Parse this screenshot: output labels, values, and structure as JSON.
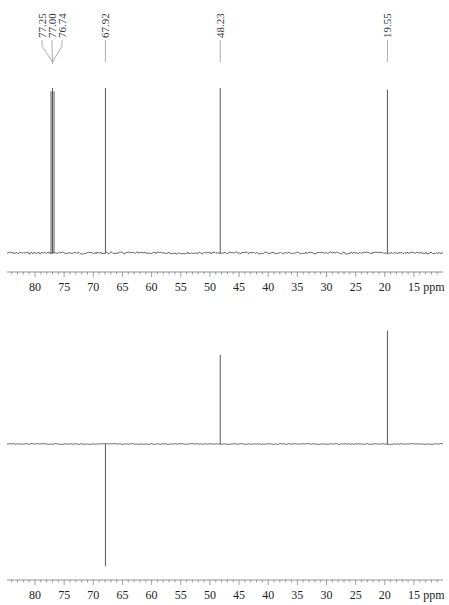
{
  "chart_data": [
    {
      "type": "line",
      "title": "13C NMR spectrum",
      "xlabel": "ppm",
      "ylabel": "",
      "xlim": [
        85,
        11
      ],
      "x_axis_reversed": true,
      "x_ticks": [
        80,
        75,
        70,
        65,
        60,
        55,
        50,
        45,
        40,
        35,
        30,
        25,
        20,
        15
      ],
      "x_unit_label": "ppm",
      "peaks": [
        {
          "ppm": 77.25,
          "label": "77.25",
          "height": 0.98,
          "sign": 1
        },
        {
          "ppm": 77.0,
          "label": "77.00",
          "height": 1.0,
          "sign": 1
        },
        {
          "ppm": 76.74,
          "label": "76.74",
          "height": 0.98,
          "sign": 1
        },
        {
          "ppm": 67.92,
          "label": "67.92",
          "height": 1.0,
          "sign": 1
        },
        {
          "ppm": 48.23,
          "label": "48.23",
          "height": 1.0,
          "sign": 1
        },
        {
          "ppm": 19.55,
          "label": "19.55",
          "height": 0.99,
          "sign": 1
        }
      ],
      "grid": false,
      "legend": null
    },
    {
      "type": "line",
      "title": "DEPT-135 spectrum",
      "xlabel": "ppm",
      "ylabel": "",
      "xlim": [
        85,
        11
      ],
      "x_axis_reversed": true,
      "x_ticks": [
        80,
        75,
        70,
        65,
        60,
        55,
        50,
        45,
        40,
        35,
        30,
        25,
        20,
        15
      ],
      "x_unit_label": "ppm",
      "peaks": [
        {
          "ppm": 67.92,
          "height": -1.0,
          "sign": -1,
          "note": "negative (CH2)"
        },
        {
          "ppm": 48.23,
          "height": 0.73,
          "sign": 1
        },
        {
          "ppm": 19.55,
          "height": 0.93,
          "sign": 1
        }
      ],
      "grid": false,
      "legend": null
    }
  ],
  "labels": {
    "peak_77_25": "77.25",
    "peak_77_00": "77.00",
    "peak_76_74": "76.74",
    "peak_67_92": "67.92",
    "peak_48_23": "48.23",
    "peak_19_55": "19.55",
    "unit": "ppm"
  }
}
